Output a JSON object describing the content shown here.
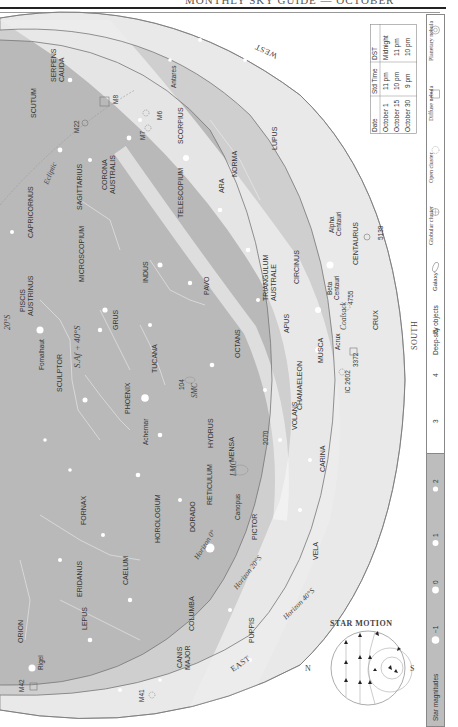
{
  "header": {
    "title": "MONTHLY SKY GUIDE — OCTOBER"
  },
  "time_table": {
    "columns": [
      "Date",
      "Std Time",
      "DST"
    ],
    "rows": [
      [
        "October 1",
        "11 pm",
        "Midnight"
      ],
      [
        "October 15",
        "10 pm",
        "11 pm"
      ],
      [
        "October 30",
        "9 pm",
        "10 pm"
      ]
    ]
  },
  "legend": {
    "star_magnitudes_label": "Star magnitudes",
    "magnitudes": [
      "−1",
      "0",
      "1",
      "2",
      "3",
      "4",
      "5"
    ],
    "deep_sky_label": "Deep-sky objects",
    "deep_sky": [
      {
        "name": "Galaxy",
        "icon": "galaxy-icon"
      },
      {
        "name": "Globular cluster",
        "icon": "globular-cluster-icon"
      },
      {
        "name": "Open cluster",
        "icon": "open-cluster-icon"
      },
      {
        "name": "Diffuse nebula",
        "icon": "diffuse-nebula-icon"
      },
      {
        "name": "Planetary nebula",
        "icon": "planetary-nebula-icon"
      }
    ]
  },
  "compass": {
    "west": "WEST",
    "east": "EAST",
    "south": "SOUTH"
  },
  "horizons": [
    "Horizon 0°",
    "Horizon 20°S",
    "Horizon 40°S"
  ],
  "zenith": {
    "label": "S.Af + 40°S",
    "lat20": "20°S"
  },
  "ecliptic": "Ecliptic",
  "constellations": [
    "SCUTUM",
    "SERPENS CAUDA",
    "SAGITTARIUS",
    "CORONA AUSTRALIS",
    "CAPRICORNUS",
    "MICROSCOPIUM",
    "SCORPIUS",
    "TELESCOPIUM",
    "ARA",
    "NORMA",
    "LUPUS",
    "PISCIS AUSTRINUS",
    "GRUS",
    "INDUS",
    "PAVO",
    "SCULPTOR",
    "PHOENIX",
    "TUCANA",
    "HYDRUS",
    "OCTANS",
    "TRIANGULUM AUSTRALE",
    "CIRCINUS",
    "APUS",
    "CENTAURUS",
    "FORNAX",
    "HOROLOGIUM",
    "RETICULUM",
    "MENSA",
    "CHAMAELEON",
    "MUSCA",
    "CRUX",
    "ERIDANUS",
    "CAELUM",
    "DORADO",
    "PICTOR",
    "VOLANS",
    "CARINA",
    "ORION",
    "LEPUS",
    "COLUMBA",
    "CANIS MAJOR",
    "PUPPIS",
    "VELA"
  ],
  "stars": [
    "Antares",
    "Fomalhaut",
    "Achernar",
    "Canopus",
    "Rigel",
    "Alpha Centauri",
    "Beta Centauri",
    "Acrux"
  ],
  "objects": [
    "M8",
    "M22",
    "M7",
    "M6",
    "104",
    "SMC",
    "LMC",
    "2070",
    "IC 2602",
    "3372",
    "4755",
    "5139",
    "Coalsack",
    "M42",
    "M41"
  ],
  "star_motion": {
    "title": "STAR MOTION",
    "n": "N",
    "s": "S"
  }
}
